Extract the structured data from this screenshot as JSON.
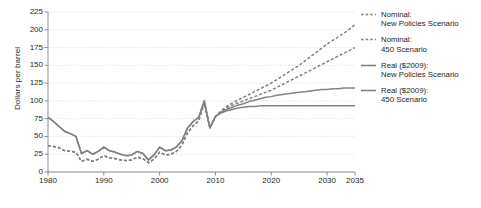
{
  "chart_data": {
    "type": "line",
    "title": "",
    "xlabel": "",
    "ylabel": "Dollars per barrel",
    "xlim": [
      1980,
      2035
    ],
    "ylim": [
      0,
      225
    ],
    "yticks": [
      0,
      25,
      50,
      75,
      100,
      125,
      150,
      175,
      200,
      225
    ],
    "xticks": [
      1980,
      1990,
      2000,
      2010,
      2020,
      2030,
      2035
    ],
    "grid": "horizontal-dotted",
    "legend_position": "right",
    "colors": {
      "line": "#808285",
      "grid": "#c8c8c8",
      "axis": "#808285",
      "text": "#231f20"
    },
    "series": [
      {
        "name": "Nominal: New Policies Scenario",
        "style": "dashed",
        "color": "#808285",
        "x": [
          1980,
          1981,
          1982,
          1983,
          1984,
          1985,
          1986,
          1987,
          1988,
          1989,
          1990,
          1991,
          1992,
          1993,
          1994,
          1995,
          1996,
          1997,
          1998,
          1999,
          2000,
          2001,
          2002,
          2003,
          2004,
          2005,
          2006,
          2007,
          2008,
          2009,
          2010,
          2011,
          2012,
          2013,
          2014,
          2015,
          2016,
          2017,
          2018,
          2019,
          2020,
          2021,
          2022,
          2023,
          2024,
          2025,
          2026,
          2027,
          2028,
          2029,
          2030,
          2031,
          2032,
          2033,
          2034,
          2035
        ],
        "y": [
          37,
          36,
          34,
          30,
          29,
          28,
          15,
          18,
          15,
          18,
          23,
          20,
          19,
          17,
          16,
          17,
          21,
          19,
          13,
          18,
          28,
          24,
          25,
          29,
          38,
          55,
          65,
          72,
          97,
          62,
          78,
          86,
          92,
          97,
          101,
          105,
          109,
          113,
          117,
          121,
          125,
          130,
          135,
          140,
          145,
          150,
          156,
          162,
          168,
          174,
          180,
          185,
          190,
          195,
          201,
          207
        ]
      },
      {
        "name": "Nominal: 450 Scenario",
        "style": "dashed",
        "color": "#808285",
        "x": [
          1980,
          1981,
          1982,
          1983,
          1984,
          1985,
          1986,
          1987,
          1988,
          1989,
          1990,
          1991,
          1992,
          1993,
          1994,
          1995,
          1996,
          1997,
          1998,
          1999,
          2000,
          2001,
          2002,
          2003,
          2004,
          2005,
          2006,
          2007,
          2008,
          2009,
          2010,
          2011,
          2012,
          2013,
          2014,
          2015,
          2016,
          2017,
          2018,
          2019,
          2020,
          2021,
          2022,
          2023,
          2024,
          2025,
          2026,
          2027,
          2028,
          2029,
          2030,
          2031,
          2032,
          2033,
          2034,
          2035
        ],
        "y": [
          37,
          36,
          34,
          30,
          29,
          28,
          15,
          18,
          15,
          18,
          23,
          20,
          19,
          17,
          16,
          17,
          21,
          19,
          13,
          18,
          28,
          24,
          25,
          29,
          38,
          55,
          65,
          72,
          97,
          62,
          78,
          85,
          90,
          94,
          97,
          100,
          103,
          106,
          109,
          112,
          115,
          119,
          123,
          127,
          131,
          135,
          139,
          143,
          147,
          151,
          155,
          159,
          163,
          167,
          171,
          175
        ]
      },
      {
        "name": "Real ($2009): New Policies Scenario",
        "style": "solid",
        "color": "#808285",
        "x": [
          1980,
          1981,
          1982,
          1983,
          1984,
          1985,
          1986,
          1987,
          1988,
          1989,
          1990,
          1991,
          1992,
          1993,
          1994,
          1995,
          1996,
          1997,
          1998,
          1999,
          2000,
          2001,
          2002,
          2003,
          2004,
          2005,
          2006,
          2007,
          2008,
          2009,
          2010,
          2011,
          2012,
          2013,
          2014,
          2015,
          2016,
          2017,
          2018,
          2019,
          2020,
          2021,
          2022,
          2023,
          2024,
          2025,
          2026,
          2027,
          2028,
          2029,
          2030,
          2031,
          2032,
          2033,
          2034,
          2035
        ],
        "y": [
          77,
          71,
          64,
          57,
          54,
          50,
          26,
          30,
          25,
          29,
          35,
          30,
          28,
          25,
          23,
          24,
          29,
          26,
          17,
          24,
          35,
          30,
          31,
          35,
          44,
          62,
          71,
          77,
          100,
          62,
          78,
          84,
          88,
          91,
          94,
          96,
          99,
          101,
          103,
          105,
          106,
          108,
          109,
          110,
          111,
          112,
          113,
          114,
          115,
          116,
          116,
          117,
          117,
          118,
          118,
          118
        ]
      },
      {
        "name": "Real ($2009): 450 Scenario",
        "style": "solid",
        "color": "#808285",
        "x": [
          1980,
          1981,
          1982,
          1983,
          1984,
          1985,
          1986,
          1987,
          1988,
          1989,
          1990,
          1991,
          1992,
          1993,
          1994,
          1995,
          1996,
          1997,
          1998,
          1999,
          2000,
          2001,
          2002,
          2003,
          2004,
          2005,
          2006,
          2007,
          2008,
          2009,
          2010,
          2011,
          2012,
          2013,
          2014,
          2015,
          2016,
          2017,
          2018,
          2019,
          2020,
          2021,
          2022,
          2023,
          2024,
          2025,
          2026,
          2027,
          2028,
          2029,
          2030,
          2031,
          2032,
          2033,
          2034,
          2035
        ],
        "y": [
          77,
          71,
          64,
          57,
          54,
          50,
          26,
          30,
          25,
          29,
          35,
          30,
          28,
          25,
          23,
          24,
          29,
          26,
          17,
          24,
          35,
          30,
          31,
          35,
          44,
          62,
          71,
          77,
          100,
          62,
          78,
          83,
          86,
          88,
          90,
          91,
          92,
          92,
          93,
          93,
          93,
          93,
          93,
          93,
          93,
          93,
          93,
          93,
          93,
          93,
          93,
          93,
          93,
          93,
          93,
          93
        ]
      }
    ],
    "legend": [
      {
        "line1": "Nominal:",
        "line2": "New Policies Scenario",
        "style": "dashed"
      },
      {
        "line1": "Nominal:",
        "line2": "450 Scenario",
        "style": "dashed"
      },
      {
        "line1": "Real ($2009):",
        "line2": "New Policies Scenario",
        "style": "solid"
      },
      {
        "line1": "Real ($2009):",
        "line2": "450 Scenario",
        "style": "solid"
      }
    ]
  }
}
